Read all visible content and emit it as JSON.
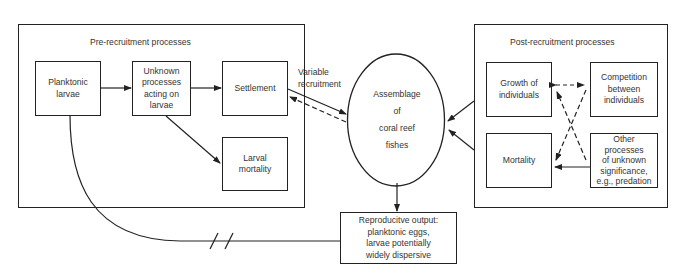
{
  "pre_recruitment": {
    "title": "Pre-recruitment processes",
    "boxes": {
      "planktonic_larvae": [
        "Planktonic",
        "larvae"
      ],
      "unknown_processes": [
        "Unknown",
        "processes",
        "acting on",
        "larvae"
      ],
      "settlement": [
        "Settlement"
      ],
      "larval_mortality": [
        "Larval",
        "mortality"
      ]
    }
  },
  "center": {
    "recruitment_label": [
      "Variable",
      "recruitment"
    ],
    "assemblage": [
      "Assemblage",
      "of",
      "coral reef",
      "fishes"
    ]
  },
  "post_recruitment": {
    "title": "Post-recruitment processes",
    "boxes": {
      "growth": [
        "Growth of",
        "individuals"
      ],
      "competition": [
        "Competition",
        "between",
        "individuals"
      ],
      "mortality": [
        "Mortality"
      ],
      "other": [
        "Other",
        "processes",
        "of unknown",
        "significance,",
        "e.g., predation"
      ]
    }
  },
  "reproductive_output": [
    "Reproducitve output:",
    "planktonic eggs,",
    "larvae potentially",
    "widely dispersive"
  ],
  "colors": {
    "line": "#222222",
    "text": "#333333",
    "background": "#ffffff"
  }
}
